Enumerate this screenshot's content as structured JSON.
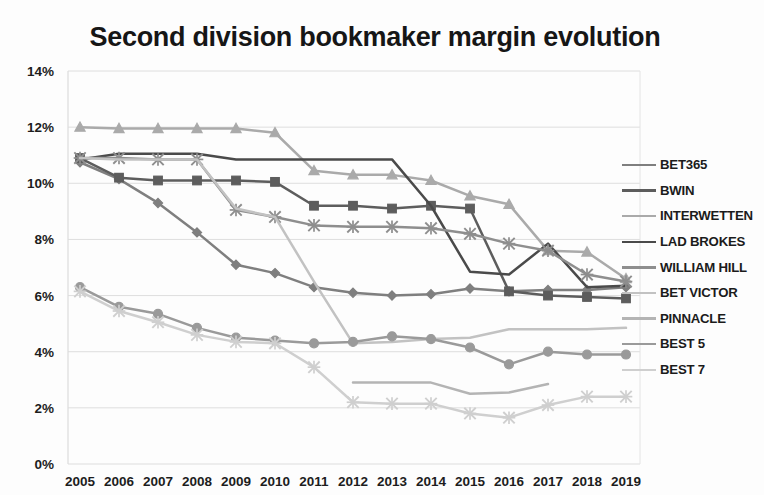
{
  "chart_data": {
    "type": "line",
    "title": "Second division bookmaker margin evolution",
    "xlabel": "",
    "ylabel": "",
    "categories": [
      2005,
      2006,
      2007,
      2008,
      2009,
      2010,
      2011,
      2012,
      2013,
      2014,
      2015,
      2016,
      2017,
      2018,
      2019
    ],
    "x": [
      "2005",
      "2006",
      "2007",
      "2008",
      "2009",
      "2010",
      "2011",
      "2012",
      "2013",
      "2014",
      "2015",
      "2016",
      "2017",
      "2018",
      "2019"
    ],
    "ylim": [
      0,
      14
    ],
    "ytick_values": [
      0,
      2,
      4,
      6,
      8,
      10,
      12,
      14
    ],
    "ytick_labels": [
      "0%",
      "2%",
      "4%",
      "6%",
      "8%",
      "10%",
      "12%",
      "14%"
    ],
    "grid": true,
    "legend_position": "right",
    "units": "percent",
    "series": [
      {
        "name": "BET365",
        "color": "#7f7f7f",
        "marker": "diamond",
        "values": [
          10.75,
          10.15,
          9.3,
          8.25,
          7.1,
          6.8,
          6.3,
          6.1,
          6.0,
          6.05,
          6.25,
          6.15,
          6.2,
          6.2,
          6.3
        ]
      },
      {
        "name": "BWIN",
        "color": "#5d5d5d",
        "marker": "square",
        "values": [
          10.9,
          10.2,
          10.1,
          10.1,
          10.1,
          10.05,
          9.2,
          9.2,
          9.1,
          9.2,
          9.1,
          6.15,
          6.0,
          5.95,
          5.9
        ]
      },
      {
        "name": "INTERWETTEN",
        "color": "#aaaaaa",
        "marker": "triangle",
        "values": [
          12.0,
          11.95,
          11.95,
          11.95,
          11.95,
          11.8,
          10.45,
          10.3,
          10.3,
          10.1,
          9.55,
          9.25,
          7.6,
          7.55,
          6.6
        ]
      },
      {
        "name": "LAD BROKES",
        "color": "#4a4a4a",
        "marker": "none",
        "values": [
          10.85,
          11.05,
          11.05,
          11.05,
          10.85,
          10.85,
          10.85,
          10.85,
          10.85,
          9.2,
          6.85,
          6.75,
          7.85,
          6.3,
          6.35
        ]
      },
      {
        "name": "WILLIAM HILL",
        "color": "#8e8e8e",
        "marker": "x",
        "values": [
          10.9,
          10.9,
          10.85,
          10.85,
          9.05,
          8.8,
          8.5,
          8.45,
          8.45,
          8.4,
          8.2,
          7.85,
          7.6,
          6.75,
          6.5
        ]
      },
      {
        "name": "BET VICTOR",
        "color": "#c2c2c2",
        "marker": "none",
        "values": [
          10.9,
          10.85,
          10.85,
          10.85,
          9.1,
          8.8,
          6.5,
          4.3,
          4.35,
          4.45,
          4.5,
          4.8,
          4.8,
          4.8,
          4.85
        ]
      },
      {
        "name": "PINNACLE",
        "color": "#b4b4b4",
        "marker": "none",
        "values": [
          null,
          null,
          null,
          null,
          null,
          null,
          null,
          2.9,
          2.9,
          2.9,
          2.5,
          2.55,
          2.85,
          null,
          null
        ]
      },
      {
        "name": "BEST 5",
        "color": "#9a9a9a",
        "marker": "circle",
        "values": [
          6.3,
          5.6,
          5.35,
          4.85,
          4.5,
          4.4,
          4.3,
          4.35,
          4.55,
          4.45,
          4.15,
          3.55,
          4.0,
          3.9,
          3.9
        ]
      },
      {
        "name": "BEST 7",
        "color": "#cfcfcf",
        "marker": "x",
        "values": [
          6.15,
          5.45,
          5.05,
          4.6,
          4.35,
          4.3,
          3.45,
          2.2,
          2.15,
          2.15,
          1.8,
          1.65,
          2.1,
          2.4,
          2.4
        ]
      }
    ]
  },
  "legend": {
    "items": [
      {
        "label": "BET365"
      },
      {
        "label": "BWIN"
      },
      {
        "label": "INTERWETTEN"
      },
      {
        "label": "LAD BROKES"
      },
      {
        "label": "WILLIAM HILL"
      },
      {
        "label": "BET VICTOR"
      },
      {
        "label": "PINNACLE"
      },
      {
        "label": "BEST 5"
      },
      {
        "label": "BEST 7"
      }
    ]
  }
}
